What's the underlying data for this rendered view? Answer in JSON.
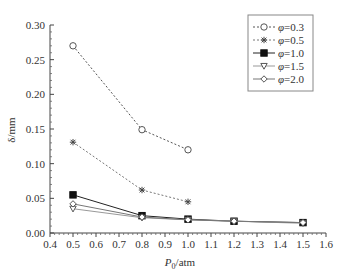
{
  "chart_data": {
    "type": "line",
    "title": "",
    "xlabel": "P0/atm",
    "xlabel_main": "P",
    "xlabel_sub": "0",
    "xlabel_unit": "/atm",
    "ylabel": "δ/mm",
    "xlim": [
      0.4,
      1.6
    ],
    "ylim": [
      0.0,
      0.3
    ],
    "xticks": [
      "0.4",
      "0.5",
      "0.6",
      "0.7",
      "0.8",
      "0.9",
      "1.0",
      "1.1",
      "1.2",
      "1.3",
      "1.4",
      "1.5",
      "1.6"
    ],
    "yticks": [
      "0.00",
      "0.05",
      "0.10",
      "0.15",
      "0.20",
      "0.25",
      "0.30"
    ],
    "grid": false,
    "legend_position": "upper right",
    "series": [
      {
        "name": "φ=0.3",
        "label": "φ=0.3",
        "marker": "open-circle",
        "line": "dotted",
        "color": "#555555",
        "x": [
          0.5,
          0.8,
          1.0
        ],
        "values": [
          0.27,
          0.149,
          0.12
        ]
      },
      {
        "name": "φ=0.5",
        "label": "φ=0.5",
        "marker": "asterisk",
        "line": "dotted",
        "color": "#777777",
        "x": [
          0.5,
          0.8,
          1.0
        ],
        "values": [
          0.131,
          0.062,
          0.045
        ]
      },
      {
        "name": "φ=1.0",
        "label": "φ=1.0",
        "marker": "filled-square",
        "line": "solid",
        "color": "#222222",
        "x": [
          0.5,
          0.8,
          1.0,
          1.2,
          1.5
        ],
        "values": [
          0.055,
          0.025,
          0.02,
          0.017,
          0.015
        ]
      },
      {
        "name": "φ=1.5",
        "label": "φ=1.5",
        "marker": "open-triangle-down",
        "line": "solid",
        "color": "#999999",
        "x": [
          0.5,
          0.8,
          1.0,
          1.2,
          1.5
        ],
        "values": [
          0.035,
          0.022,
          0.019,
          0.017,
          0.014
        ]
      },
      {
        "name": "φ=2.0",
        "label": "φ=2.0",
        "marker": "open-diamond",
        "line": "solid",
        "color": "#777777",
        "x": [
          0.5,
          0.8,
          1.0,
          1.2,
          1.5
        ],
        "values": [
          0.042,
          0.023,
          0.019,
          0.017,
          0.015
        ]
      }
    ]
  }
}
